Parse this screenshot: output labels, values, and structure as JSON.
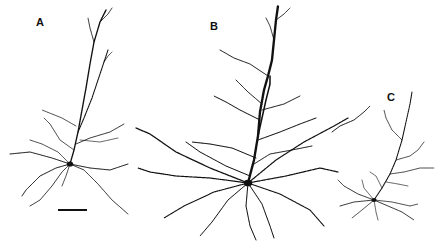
{
  "figure": {
    "background": "#ffffff",
    "ink": "#111111",
    "panels": [
      {
        "label": "A",
        "label_pos": [
          36,
          26
        ],
        "soma": [
          70,
          164
        ],
        "soma_r": 3.2,
        "apical": [
          {
            "d": "M70 164 L74 150 L78 132 L82 110 L86 88 L90 64 L94 42 L100 22 L106 10",
            "w": 1.4
          },
          {
            "d": "M78 132 L84 118 L92 98 L98 80 L104 62 L108 50",
            "w": 1.1
          },
          {
            "d": "M94 42 L90 28 L88 18",
            "w": 0.8
          },
          {
            "d": "M100 22 L108 14 L112 8",
            "w": 0.8
          },
          {
            "d": "M104 62 L108 56 L112 52",
            "w": 0.7
          }
        ],
        "basal": [
          {
            "d": "M70 164 L52 158 L30 152 L10 154",
            "w": 0.9
          },
          {
            "d": "M70 164 L56 168 L40 176 L26 190 L22 196",
            "w": 0.9
          },
          {
            "d": "M70 164 L62 172 L52 186 L40 200 L30 206",
            "w": 0.8
          },
          {
            "d": "M70 164 L90 168 L110 170 L128 164",
            "w": 0.9
          },
          {
            "d": "M70 164 L84 170 L98 184 L112 200 L128 214",
            "w": 0.8
          },
          {
            "d": "M70 164 L66 176 L62 186",
            "w": 0.7
          },
          {
            "d": "M70 164 L58 152 L42 144 L30 140",
            "w": 0.7
          },
          {
            "d": "M76 144 L90 138 L110 132 L124 124",
            "w": 0.8
          },
          {
            "d": "M74 150 L60 140 L50 124 L44 118",
            "w": 0.7
          },
          {
            "d": "M76 126 L62 118 L42 110",
            "w": 0.7
          },
          {
            "d": "M80 140 L100 142 L118 138",
            "w": 0.6
          }
        ],
        "scale_bar": {
          "x1": 58,
          "x2": 87,
          "y": 210,
          "w": 2
        }
      },
      {
        "label": "B",
        "label_pos": [
          210,
          30
        ],
        "soma": [
          248,
          183
        ],
        "soma_r": 4.2,
        "apical": [
          {
            "d": "M248 183 L254 160 L258 136 L260 112 L264 90 L268 76 L272 60 L274 40 L276 20 L278 6",
            "w": 2.4
          },
          {
            "d": "M258 136 L262 118 L266 100 L270 84 L270 76",
            "w": 1.6
          },
          {
            "d": "M274 40 L270 26 L266 18",
            "w": 0.8
          },
          {
            "d": "M276 20 L284 14 L290 8",
            "w": 0.8
          },
          {
            "d": "M268 76 L250 64 L234 58 L220 50",
            "w": 0.9
          },
          {
            "d": "M262 104 L248 92 L236 80",
            "w": 0.9
          }
        ],
        "basal": [
          {
            "d": "M248 183 L210 168 L176 152 L150 134 L136 128",
            "w": 1.3
          },
          {
            "d": "M248 183 L210 178 L176 176 L150 172 L138 168",
            "w": 1.2
          },
          {
            "d": "M248 183 L214 192 L184 206 L164 218",
            "w": 1.1
          },
          {
            "d": "M248 183 L228 200 L212 222 L200 236",
            "w": 1.0
          },
          {
            "d": "M248 183 L246 206 L250 226 L256 240",
            "w": 1.0
          },
          {
            "d": "M248 183 L262 204 L270 226 L274 238",
            "w": 1.0
          },
          {
            "d": "M248 183 L280 194 L310 210 L324 226",
            "w": 1.1
          },
          {
            "d": "M248 183 L286 176 L320 168 L338 172",
            "w": 1.2
          },
          {
            "d": "M248 183 L276 160 L304 142 L334 126 L348 118",
            "w": 1.2
          },
          {
            "d": "M256 158 L232 148 L210 144 L192 142",
            "w": 1.0
          },
          {
            "d": "M258 140 L280 132 L300 124 L316 118",
            "w": 1.0
          },
          {
            "d": "M260 120 L240 110 L226 102 L214 96",
            "w": 1.0
          },
          {
            "d": "M262 110 L284 104 L300 96",
            "w": 0.9
          },
          {
            "d": "M254 164 L270 154 L292 150 L312 146",
            "w": 0.9
          },
          {
            "d": "M250 176 L226 166 L200 152 L186 142",
            "w": 1.0
          }
        ]
      },
      {
        "label": "C",
        "label_pos": [
          387,
          101
        ],
        "soma": [
          374,
          200
        ],
        "soma_r": 2.6,
        "apical": [
          {
            "d": "M374 200 L382 188 L390 174 L396 160 L402 140 L406 122 L410 104 L412 92",
            "w": 1.1
          },
          {
            "d": "M402 140 L392 130 L386 118 L384 110",
            "w": 0.7
          },
          {
            "d": "M396 160 L410 156 L418 150 L424 142",
            "w": 0.7
          },
          {
            "d": "M390 174 L404 172 L420 168 L434 168",
            "w": 0.7
          },
          {
            "d": "M386 182 L398 184 L408 186",
            "w": 0.6
          },
          {
            "d": "M382 188 L376 176 L370 172",
            "w": 0.6
          }
        ],
        "basal": [
          {
            "d": "M374 200 L358 194 L344 186 L338 180",
            "w": 0.8
          },
          {
            "d": "M374 200 L354 202 L340 206",
            "w": 0.8
          },
          {
            "d": "M374 200 L362 210 L352 218",
            "w": 0.7
          },
          {
            "d": "M374 200 L388 206 L402 212 L414 220",
            "w": 0.8
          },
          {
            "d": "M374 200 L392 202 L410 206 L418 204",
            "w": 0.7
          },
          {
            "d": "M374 200 L376 212 L378 220",
            "w": 0.6
          },
          {
            "d": "M374 200 L364 188 L362 180",
            "w": 0.6
          }
        ]
      }
    ],
    "stray_branch": {
      "d": "M332 132 L340 126 L354 120 L364 112 L370 106",
      "w": 0.9
    }
  }
}
